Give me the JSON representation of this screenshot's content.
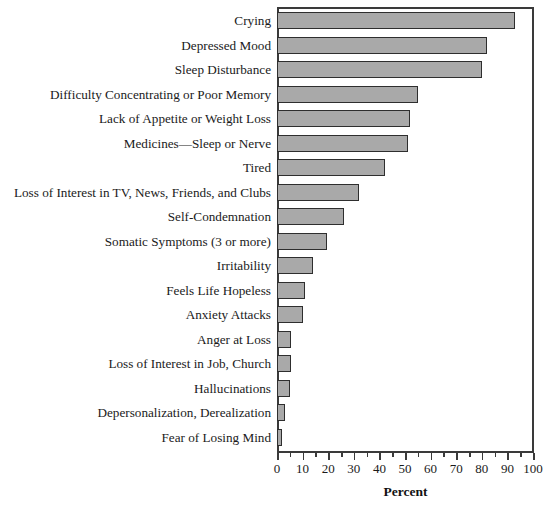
{
  "chart_data": {
    "type": "bar",
    "orientation": "horizontal",
    "title": "",
    "xlabel": "Percent",
    "ylabel": "",
    "xlim": [
      0,
      100
    ],
    "xticks": [
      0,
      10,
      20,
      30,
      40,
      50,
      60,
      70,
      80,
      90,
      100
    ],
    "xtick_labels": [
      "0",
      "10",
      "20",
      "30",
      "40",
      "50",
      "60",
      "70",
      "80",
      "90",
      "100"
    ],
    "minor_xticks": [
      5,
      15,
      25,
      35,
      45,
      55,
      65,
      75,
      85,
      95
    ],
    "grid": false,
    "legend": null,
    "bar_color": "#a9a9a9",
    "bar_edge_color": "#2e2e2e",
    "axis_color": "#3a3a3a",
    "categories": [
      "Crying",
      "Depressed Mood",
      "Sleep Disturbance",
      "Difficulty Concentrating or Poor Memory",
      "Lack of Appetite or Weight Loss",
      "Medicines—Sleep or Nerve",
      "Tired",
      "Loss of Interest in TV, News, Friends, and Clubs",
      "Self-Condemnation",
      "Somatic Symptoms (3 or more)",
      "Irritability",
      "Feels Life Hopeless",
      "Anxiety Attacks",
      "Anger at Loss",
      "Loss of Interest in Job, Church",
      "Hallucinations",
      "Depersonalization, Derealization",
      "Fear of Losing Mind"
    ],
    "values": [
      93,
      82,
      80,
      55,
      52,
      51,
      42,
      32,
      26,
      19.5,
      14,
      11,
      10,
      5.5,
      5.5,
      5,
      3,
      2
    ]
  }
}
